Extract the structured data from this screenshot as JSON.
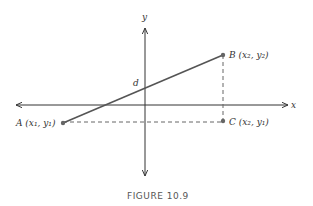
{
  "figure": {
    "caption": "FIGURE 10.9",
    "axes": {
      "x_label": "x",
      "y_label": "y"
    },
    "points": {
      "A": {
        "label": "A (x₁, y₁)"
      },
      "B": {
        "label": "B (x₂, y₂)"
      },
      "C": {
        "label": "C (x₂, y₁)"
      }
    },
    "segment_label": "d",
    "colors": {
      "line": "#555555",
      "axis": "#333333",
      "point": "#666666"
    }
  }
}
